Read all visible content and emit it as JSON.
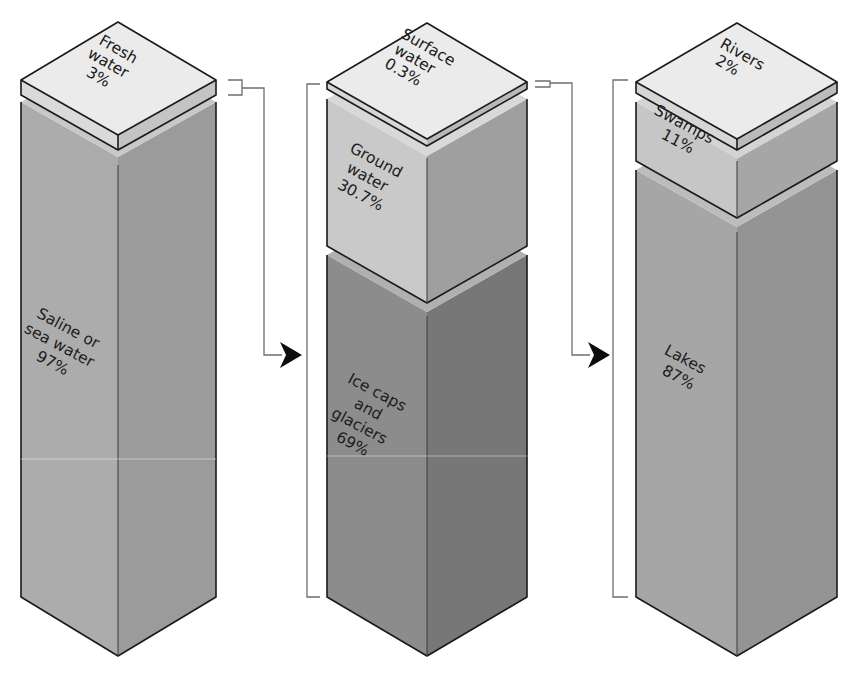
{
  "diagram": {
    "type": "isometric stacked columns",
    "columns": [
      {
        "id": "earth-water",
        "segments": [
          {
            "name": "Fresh water",
            "line1": "Fresh",
            "line2": "water",
            "line3": "3%",
            "percent": 3,
            "position": "top-slab",
            "color_left": "#dadada",
            "color_right": "#c4c4c4"
          },
          {
            "name": "Saline or sea water",
            "line1": "Saline or",
            "line2": "sea water",
            "line3": "97%",
            "percent": 97,
            "position": "body",
            "color_left": "#acacac",
            "color_right": "#9b9b9b"
          }
        ]
      },
      {
        "id": "fresh-water",
        "segments": [
          {
            "name": "Surface water",
            "line1": "Surface",
            "line2": "water",
            "line3": "0.3%",
            "percent": 0.3,
            "position": "top-slab",
            "color_left": "#d6d6d6",
            "color_right": "#b8b8b8"
          },
          {
            "name": "Ground water",
            "line1": "Ground",
            "line2": "water",
            "line3": "30.7%",
            "percent": 30.7,
            "position": "middle",
            "color_left": "#c9c9c9",
            "color_right": "#9f9f9f"
          },
          {
            "name": "Ice caps and glaciers",
            "line1": "Ice caps",
            "line2": "and",
            "line3": "glaciers",
            "line4": "69%",
            "percent": 69,
            "position": "body",
            "color_left": "#8c8c8c",
            "color_right": "#777777"
          }
        ]
      },
      {
        "id": "surface-water",
        "segments": [
          {
            "name": "Rivers",
            "line1": "Rivers",
            "line2": "2%",
            "percent": 2,
            "position": "top-slab",
            "color_left": "#d6d6d6",
            "color_right": "#bbbbbb"
          },
          {
            "name": "Swamps",
            "line1": "Swamps",
            "line2": "11%",
            "percent": 11,
            "position": "middle",
            "color_left": "#c6c6c6",
            "color_right": "#a6a6a6"
          },
          {
            "name": "Lakes",
            "line1": "Lakes",
            "line2": "87%",
            "percent": 87,
            "position": "body",
            "color_left": "#a6a6a6",
            "color_right": "#949494"
          }
        ]
      }
    ],
    "connectors": [
      {
        "from": "Fresh water",
        "to": "fresh-water column",
        "arrow": "right-pointing-triangle"
      },
      {
        "from": "Surface water",
        "to": "surface-water column",
        "arrow": "right-pointing-triangle"
      }
    ],
    "colors": {
      "outline": "#1a1a1a",
      "top_face": "#ebebeb",
      "connector": "#6e6e6e",
      "arrow": "#0d0d0d",
      "background": "#ffffff"
    }
  }
}
